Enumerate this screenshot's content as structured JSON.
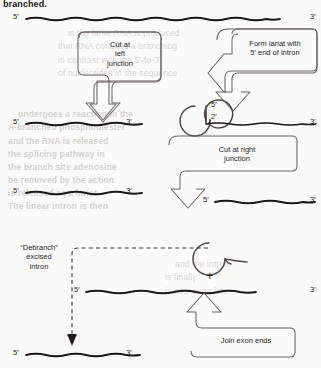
{
  "figure": {
    "title_fragment": "branched.",
    "type": "rna-splicing-lariat-pathway",
    "background_note": "scanned book page with faint show-through text"
  },
  "steps": [
    {
      "id": "cut-left",
      "label": "Cut at\nleft\njunction"
    },
    {
      "id": "form-lariat",
      "label": "Form lariat with\n5′ end of intron"
    },
    {
      "id": "cut-right",
      "label": "Cut at right\njunction"
    },
    {
      "id": "debranch",
      "label": "“Debranch”\nexcised\nintron"
    },
    {
      "id": "join-exons",
      "label": "Join exon ends"
    }
  ],
  "strands": [
    {
      "id": "strand-full",
      "five": "5′",
      "three": "3′"
    },
    {
      "id": "strand-left-exon",
      "five": "5′",
      "three": "3′"
    },
    {
      "id": "strand-right-piece",
      "five": "5′",
      "three": "3′"
    },
    {
      "id": "strand-mid-exon",
      "five": "5′",
      "three": "3′"
    },
    {
      "id": "strand-spliced",
      "five": "5′",
      "three": "3′"
    },
    {
      "id": "strand-debranched",
      "five": "5′",
      "three": "3′"
    }
  ],
  "lariat_labels": {
    "five": "5′",
    "two": "2′"
  },
  "plus_sign": "+",
  "colors": {
    "ink": "#231f1d",
    "strand": "#1b1917",
    "outline": "#55504c",
    "paper": "#fbfbfa",
    "showthrough": "#d9d7d2"
  },
  "showthrough_lines": [
    "is the lariat RNA is produced",
    "that RNA contains a branching",
    "in contrast with the 5'-to-3'",
    "of nucleotides in the sequence",
    "undergoes a reaction in the",
    "A-branched phosphodiester",
    "and the RNA is released",
    "the splicing pathway in",
    "the branch site adenosine",
    "be removed by the action",
    "is released as a lariat",
    "The linear intron is then",
    "degraded in the nucleus"
  ]
}
